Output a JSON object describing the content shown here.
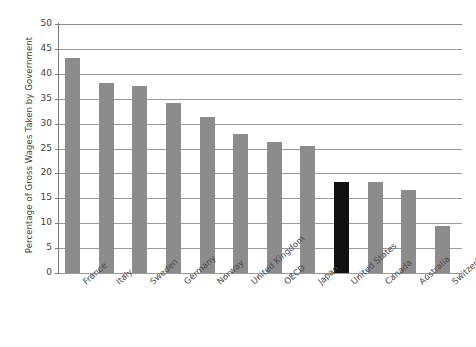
{
  "chart_data": {
    "type": "bar",
    "title": "",
    "xlabel": "",
    "ylabel": "Percentage of Gross Wages Taken by Government",
    "ylim": [
      0,
      50
    ],
    "ytick_step": 5,
    "yticks": [
      "0",
      "5",
      "10",
      "15",
      "20",
      "25",
      "30",
      "35",
      "40",
      "45",
      "50"
    ],
    "grid": true,
    "legend": "none",
    "categories": [
      "France",
      "Italy",
      "Sweden",
      "Germany",
      "Norway",
      "United Kingdom",
      "OECD",
      "Japan",
      "United States",
      "Canada",
      "Australia",
      "Switzerland"
    ],
    "values": [
      43.1,
      38.2,
      37.6,
      34.1,
      31.4,
      27.9,
      26.3,
      25.5,
      18.2,
      18.2,
      16.6,
      9.5
    ],
    "highlight_category": "United States",
    "colors": {
      "bar": "#8c8c8c",
      "highlight_bar": "#111111",
      "gridline": "#9a9a9a",
      "axis": "#7b7b7b",
      "text": "#3f3f3f",
      "background": "#ffffff"
    }
  }
}
